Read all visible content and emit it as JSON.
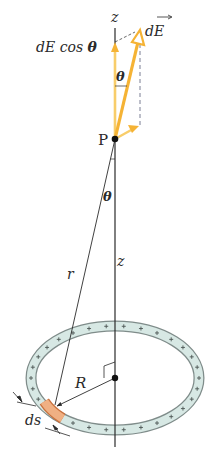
{
  "diagram": {
    "colors": {
      "field_vector": "#f5b335",
      "field_vector_light": "#f8cd6a",
      "ring_fill": "#d7e8e4",
      "ring_edge": "#7f8c8a",
      "ds_segment": "#f0b083",
      "ds_edge": "#c9713d",
      "line": "#2b2b2b",
      "dashed": "#6b7088"
    },
    "labels": {
      "z_top": "z",
      "dE": "dE",
      "dE_cos_theta_prefix": "dE cos ",
      "theta_symbol": "θ",
      "theta_upper": "θ",
      "point": "P",
      "theta_lower": "θ",
      "r": "r",
      "z_mid": "z",
      "R": "R",
      "ds": "ds",
      "charge_sign": "+"
    },
    "geometry": {
      "axis_x": 115,
      "point_P": [
        115,
        139
      ],
      "ring_center": [
        115,
        378
      ],
      "ring_rx": 84,
      "ring_ry": 52,
      "ring_width": 9,
      "dE_tip": [
        140,
        30
      ],
      "ds_point": [
        55,
        407
      ]
    }
  }
}
